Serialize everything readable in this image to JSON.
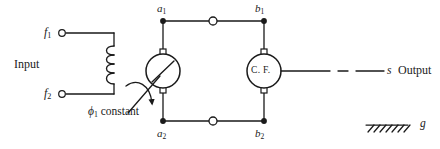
{
  "figure": {
    "type": "electrical-schematic",
    "stroke_color": "#1a1a1a",
    "background_color": "#ffffff"
  },
  "input_section": {
    "label": "Input",
    "terminals": [
      {
        "name": "f1",
        "base": "f",
        "subscript": "1",
        "x": 62,
        "y": 33,
        "style": "open-circle"
      },
      {
        "name": "f2",
        "base": "f",
        "subscript": "2",
        "x": 62,
        "y": 94,
        "style": "open-circle"
      }
    ],
    "coil": {
      "name": "field-winding",
      "turns": 4,
      "x": 114,
      "y_top": 48,
      "y_bottom": 84
    }
  },
  "generator": {
    "name": "generator-machine",
    "symbol": "circle-with-slash",
    "cx": 163,
    "cy": 71,
    "r": 17,
    "flux_label_base": "ϕ",
    "flux_label_subscript": "1",
    "flux_label_text": "constant",
    "rotation_indicator": "curved-arrow"
  },
  "cross_field": {
    "name": "cross-field-unit",
    "label": "C. F.",
    "cx": 264,
    "cy": 71,
    "r": 17
  },
  "nodes": {
    "a1": {
      "label_base": "a",
      "label_subscript": "1",
      "x": 163,
      "y": 21
    },
    "a2": {
      "label_base": "a",
      "label_subscript": "2",
      "x": 163,
      "y": 121
    },
    "b1": {
      "label_base": "b",
      "label_subscript": "1",
      "x": 264,
      "y": 21
    },
    "b2": {
      "label_base": "b",
      "label_subscript": "2",
      "x": 264,
      "y": 121
    },
    "top_mid_terminal": {
      "x": 213,
      "y": 21,
      "style": "open-circle"
    },
    "bottom_mid_terminal": {
      "x": 213,
      "y": 121,
      "style": "open-circle"
    }
  },
  "output_section": {
    "shaft_label": "s",
    "label": "Output",
    "line_style": "solid-dash-solid",
    "y": 71,
    "x_start": 281,
    "x_end": 384
  },
  "ground": {
    "label": "g",
    "symbol": "hatched-ground",
    "x": 366,
    "y": 125,
    "width": 42,
    "hatch_count": 7
  }
}
